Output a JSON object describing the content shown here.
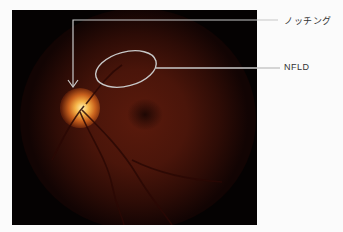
{
  "figure": {
    "image_description": "fundus photograph, left optic disc with notching and nerve fiber layer defect",
    "annotations": [
      {
        "id": "notching",
        "label": "ノッチング",
        "marker": "arrow"
      },
      {
        "id": "nfld",
        "label": "NFLD",
        "marker": "ellipse"
      }
    ],
    "colors": {
      "annotation_line": "#c8c8c8",
      "label_text": "#333333",
      "background": "#fbfbfb"
    }
  }
}
